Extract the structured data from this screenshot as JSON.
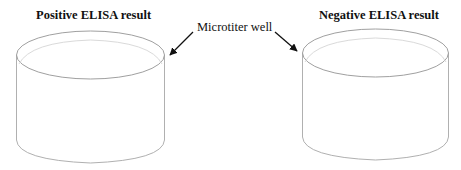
{
  "diagram": {
    "left_title": "Positive ELISA result",
    "right_title": "Negative ELISA result",
    "callout_label": "Microtiter well",
    "colors": {
      "well_outline": "#a8a8a8",
      "well_inner_rim": "#d4d4d4",
      "arrow": "#111111",
      "text": "#111111"
    },
    "wells": [
      {
        "name": "positive-well",
        "label": "Positive ELISA result"
      },
      {
        "name": "negative-well",
        "label": "Negative ELISA result"
      }
    ]
  }
}
